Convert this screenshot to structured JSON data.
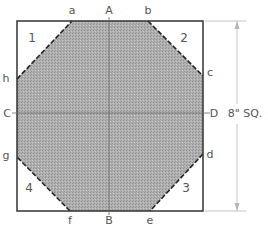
{
  "diagram": {
    "type": "octagon-from-square",
    "colors": {
      "background": "#ffffff",
      "outline": "#333333",
      "fill": "#a8a8a8",
      "centerline": "#6a6a6a",
      "dimension": "#b5b5b5",
      "text": "#555555"
    },
    "square": {
      "x": 17,
      "y": 21,
      "width": 186,
      "height": 190
    },
    "octagon_points": "72,21 148,21 203,76 203,154 150,211 70,211 17,157 17,79",
    "vertex_labels": [
      {
        "id": "a",
        "text": "a",
        "x": 72,
        "y": 14
      },
      {
        "id": "b",
        "text": "b",
        "x": 148,
        "y": 14
      },
      {
        "id": "c",
        "text": "c",
        "x": 210,
        "y": 76
      },
      {
        "id": "d",
        "text": "d",
        "x": 210,
        "y": 158
      },
      {
        "id": "e",
        "text": "e",
        "x": 150,
        "y": 224
      },
      {
        "id": "f",
        "text": "f",
        "x": 70,
        "y": 224
      },
      {
        "id": "g",
        "text": "g",
        "x": 6,
        "y": 159
      },
      {
        "id": "h",
        "text": "h",
        "x": 6,
        "y": 82
      }
    ],
    "axis_labels": [
      {
        "id": "A",
        "text": "A",
        "x": 109,
        "y": 14
      },
      {
        "id": "B",
        "text": "B",
        "x": 109,
        "y": 224
      },
      {
        "id": "C",
        "text": "C",
        "x": 7,
        "y": 117
      },
      {
        "id": "D",
        "text": "D",
        "x": 214,
        "y": 117
      }
    ],
    "corner_numbers": [
      {
        "id": "1",
        "text": "1",
        "x": 32,
        "y": 42
      },
      {
        "id": "2",
        "text": "2",
        "x": 184,
        "y": 42
      },
      {
        "id": "3",
        "text": "3",
        "x": 186,
        "y": 192
      },
      {
        "id": "4",
        "text": "4",
        "x": 29,
        "y": 192
      }
    ],
    "dimension": {
      "label": "8\" SQ.",
      "x": 237,
      "y_top": 21,
      "y_bottom": 211,
      "label_x": 237,
      "label_y": 117
    }
  }
}
